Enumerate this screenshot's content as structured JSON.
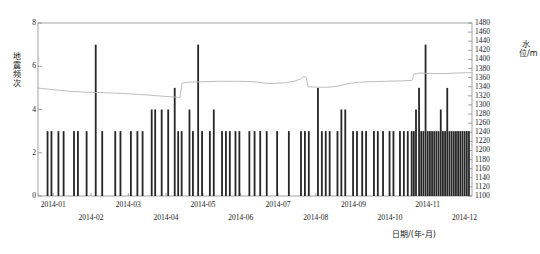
{
  "chart_data": {
    "type": "bar",
    "title": "",
    "subtitle": "",
    "xlabel": "日期/(年-月)",
    "ylabel": "地震频次",
    "y2label": "水位/m",
    "grid": false,
    "legend": "none",
    "xlim_labels": [
      "2014-01",
      "2014-12"
    ],
    "ylim": [
      0,
      8
    ],
    "ytick_values": [
      0,
      2,
      4,
      6,
      8
    ],
    "y2lim": [
      1100,
      1480
    ],
    "y2tick_values": [
      1100,
      1120,
      1140,
      1160,
      1180,
      1200,
      1220,
      1240,
      1260,
      1280,
      1300,
      1320,
      1340,
      1360,
      1380,
      1400,
      1420,
      1440,
      1460,
      1480
    ],
    "xtick_labels": [
      "2014-01",
      "2014-02",
      "2014-03",
      "2014-04",
      "2014-05",
      "2014-06",
      "2014-07",
      "2014-08",
      "2014-09",
      "2014-10",
      "2014-11",
      "2014-12"
    ],
    "xtick_positions_frac": [
      0.035,
      0.122,
      0.208,
      0.295,
      0.38,
      0.467,
      0.553,
      0.64,
      0.727,
      0.811,
      0.898,
      0.983
    ],
    "bar_color": "#262626",
    "line_color": "#b5b5b5",
    "axis_color": "#8c8c8c",
    "series": [
      {
        "name": "地震频次",
        "type": "bar",
        "unit": "次",
        "values_by_position": [
          [
            0.022,
            3
          ],
          [
            0.031,
            3
          ],
          [
            0.047,
            3
          ],
          [
            0.059,
            3
          ],
          [
            0.083,
            3
          ],
          [
            0.092,
            3
          ],
          [
            0.112,
            3
          ],
          [
            0.133,
            7
          ],
          [
            0.148,
            3
          ],
          [
            0.178,
            3
          ],
          [
            0.19,
            3
          ],
          [
            0.214,
            3
          ],
          [
            0.229,
            3
          ],
          [
            0.241,
            3
          ],
          [
            0.262,
            4
          ],
          [
            0.27,
            4
          ],
          [
            0.285,
            4
          ],
          [
            0.3,
            4
          ],
          [
            0.315,
            5
          ],
          [
            0.323,
            3
          ],
          [
            0.331,
            3
          ],
          [
            0.349,
            4
          ],
          [
            0.357,
            3
          ],
          [
            0.369,
            7
          ],
          [
            0.378,
            3
          ],
          [
            0.396,
            3
          ],
          [
            0.405,
            4
          ],
          [
            0.424,
            3
          ],
          [
            0.433,
            3
          ],
          [
            0.442,
            3
          ],
          [
            0.455,
            3
          ],
          [
            0.464,
            3
          ],
          [
            0.487,
            3
          ],
          [
            0.499,
            3
          ],
          [
            0.512,
            3
          ],
          [
            0.527,
            3
          ],
          [
            0.551,
            3
          ],
          [
            0.578,
            3
          ],
          [
            0.606,
            3
          ],
          [
            0.615,
            3
          ],
          [
            0.624,
            3
          ],
          [
            0.645,
            5
          ],
          [
            0.654,
            3
          ],
          [
            0.663,
            3
          ],
          [
            0.672,
            3
          ],
          [
            0.69,
            3
          ],
          [
            0.699,
            4
          ],
          [
            0.708,
            4
          ],
          [
            0.726,
            3
          ],
          [
            0.735,
            3
          ],
          [
            0.747,
            3
          ],
          [
            0.756,
            3
          ],
          [
            0.774,
            3
          ],
          [
            0.783,
            3
          ],
          [
            0.795,
            3
          ],
          [
            0.81,
            3
          ],
          [
            0.819,
            3
          ],
          [
            0.834,
            3
          ],
          [
            0.843,
            3
          ],
          [
            0.852,
            3
          ],
          [
            0.861,
            3
          ],
          [
            0.866,
            3
          ],
          [
            0.871,
            4
          ],
          [
            0.878,
            5
          ],
          [
            0.883,
            3
          ],
          [
            0.888,
            3
          ],
          [
            0.893,
            7
          ],
          [
            0.898,
            3
          ],
          [
            0.903,
            3
          ],
          [
            0.908,
            3
          ],
          [
            0.913,
            3
          ],
          [
            0.918,
            3
          ],
          [
            0.923,
            3
          ],
          [
            0.928,
            4
          ],
          [
            0.933,
            3
          ],
          [
            0.938,
            3
          ],
          [
            0.943,
            5
          ],
          [
            0.948,
            3
          ],
          [
            0.953,
            3
          ],
          [
            0.958,
            3
          ],
          [
            0.963,
            3
          ],
          [
            0.968,
            3
          ],
          [
            0.973,
            3
          ],
          [
            0.978,
            3
          ],
          [
            0.983,
            3
          ],
          [
            0.988,
            3
          ],
          [
            0.993,
            3
          ]
        ]
      },
      {
        "name": "水位",
        "type": "line",
        "unit": "m",
        "points_frac_value": [
          [
            0.0,
            1337
          ],
          [
            0.04,
            1333
          ],
          [
            0.075,
            1330
          ],
          [
            0.11,
            1328
          ],
          [
            0.15,
            1327
          ],
          [
            0.2,
            1325
          ],
          [
            0.25,
            1322
          ],
          [
            0.29,
            1319
          ],
          [
            0.32,
            1317
          ],
          [
            0.327,
            1316
          ],
          [
            0.332,
            1348
          ],
          [
            0.345,
            1350
          ],
          [
            0.38,
            1351
          ],
          [
            0.42,
            1352
          ],
          [
            0.46,
            1352
          ],
          [
            0.5,
            1351
          ],
          [
            0.52,
            1348
          ],
          [
            0.54,
            1347
          ],
          [
            0.555,
            1348
          ],
          [
            0.57,
            1349
          ],
          [
            0.59,
            1352
          ],
          [
            0.605,
            1357
          ],
          [
            0.612,
            1362
          ],
          [
            0.618,
            1361
          ],
          [
            0.622,
            1340
          ],
          [
            0.64,
            1339
          ],
          [
            0.67,
            1339
          ],
          [
            0.69,
            1341
          ],
          [
            0.71,
            1346
          ],
          [
            0.73,
            1349
          ],
          [
            0.76,
            1351
          ],
          [
            0.8,
            1352
          ],
          [
            0.84,
            1353
          ],
          [
            0.862,
            1354
          ],
          [
            0.866,
            1368
          ],
          [
            0.88,
            1370
          ],
          [
            0.91,
            1369
          ],
          [
            0.94,
            1369
          ],
          [
            0.96,
            1370
          ],
          [
            1.0,
            1371
          ]
        ]
      }
    ]
  }
}
